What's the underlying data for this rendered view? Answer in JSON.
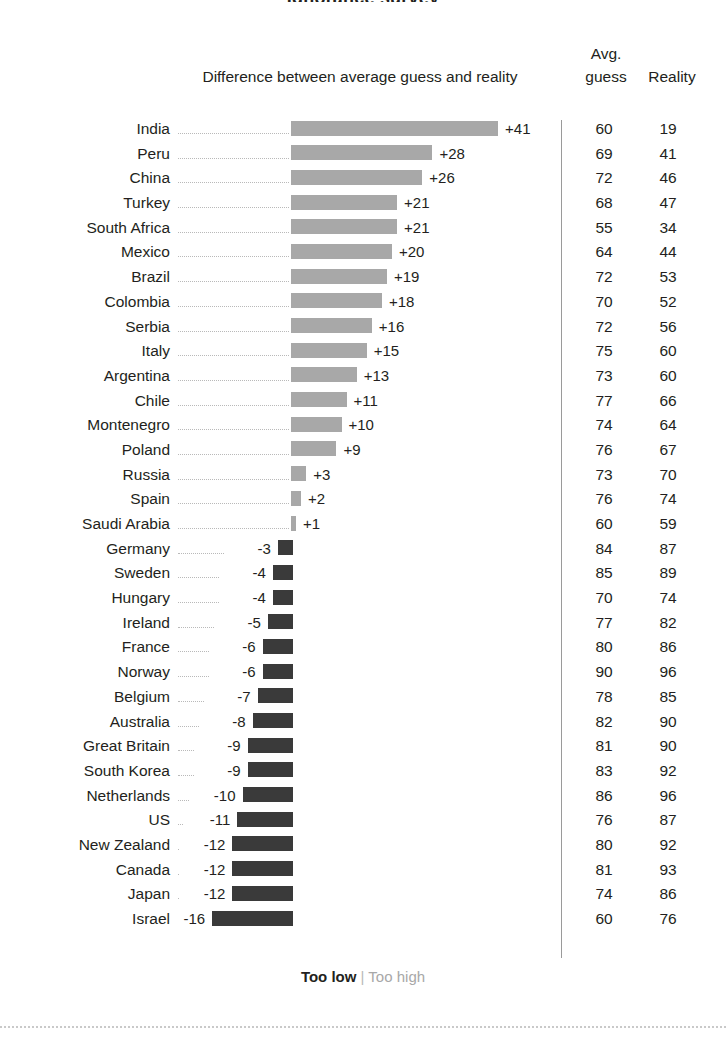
{
  "title": "Ignorance survey",
  "headers": {
    "difference": "Difference between average guess and reality",
    "avg_line1": "Avg.",
    "avg_line2": "guess",
    "reality": "Reality"
  },
  "legend": {
    "too_low": "Too low",
    "separator": "|",
    "too_high": "Too high"
  },
  "colors": {
    "too_low_bar": "#3a3a3a",
    "too_high_bar": "#a8a8a8",
    "text": "#231f20",
    "leader": "#b9b9b9",
    "rule": "#9a9a9a"
  },
  "chart_data": {
    "type": "bar",
    "title": "Difference between average guess and reality",
    "xlabel": "",
    "ylabel": "",
    "orientation": "horizontal",
    "grid": false,
    "legend_position": "bottom",
    "baseline": 0,
    "xlim": [
      -16,
      41
    ],
    "categories": [
      "India",
      "Peru",
      "China",
      "Turkey",
      "South Africa",
      "Mexico",
      "Brazil",
      "Colombia",
      "Serbia",
      "Italy",
      "Argentina",
      "Chile",
      "Montenegro",
      "Poland",
      "Russia",
      "Spain",
      "Saudi Arabia",
      "Germany",
      "Sweden",
      "Hungary",
      "Ireland",
      "France",
      "Norway",
      "Belgium",
      "Australia",
      "Great Britain",
      "South Korea",
      "Netherlands",
      "US",
      "New Zealand",
      "Canada",
      "Japan",
      "Israel"
    ],
    "series": [
      {
        "name": "Difference",
        "values": [
          41,
          28,
          26,
          21,
          21,
          20,
          19,
          18,
          16,
          15,
          13,
          11,
          10,
          9,
          3,
          2,
          1,
          -3,
          -4,
          -4,
          -5,
          -6,
          -6,
          -7,
          -8,
          -9,
          -9,
          -10,
          -11,
          -12,
          -12,
          -12,
          -16
        ]
      },
      {
        "name": "Avg. guess",
        "values": [
          60,
          69,
          72,
          68,
          55,
          64,
          72,
          70,
          72,
          75,
          73,
          77,
          74,
          76,
          73,
          76,
          60,
          84,
          85,
          70,
          77,
          80,
          90,
          78,
          82,
          81,
          83,
          86,
          76,
          80,
          81,
          74,
          60
        ]
      },
      {
        "name": "Reality",
        "values": [
          19,
          41,
          46,
          47,
          34,
          44,
          53,
          52,
          56,
          60,
          60,
          66,
          64,
          67,
          70,
          74,
          59,
          87,
          89,
          74,
          82,
          86,
          96,
          85,
          90,
          90,
          92,
          96,
          87,
          92,
          93,
          86,
          76
        ]
      }
    ]
  },
  "rows": [
    {
      "label": "India",
      "diff": 41,
      "diff_text": "+41",
      "guess": "60",
      "reality": "19"
    },
    {
      "label": "Peru",
      "diff": 28,
      "diff_text": "+28",
      "guess": "69",
      "reality": "41"
    },
    {
      "label": "China",
      "diff": 26,
      "diff_text": "+26",
      "guess": "72",
      "reality": "46"
    },
    {
      "label": "Turkey",
      "diff": 21,
      "diff_text": "+21",
      "guess": "68",
      "reality": "47"
    },
    {
      "label": "South Africa",
      "diff": 21,
      "diff_text": "+21",
      "guess": "55",
      "reality": "34"
    },
    {
      "label": "Mexico",
      "diff": 20,
      "diff_text": "+20",
      "guess": "64",
      "reality": "44"
    },
    {
      "label": "Brazil",
      "diff": 19,
      "diff_text": "+19",
      "guess": "72",
      "reality": "53"
    },
    {
      "label": "Colombia",
      "diff": 18,
      "diff_text": "+18",
      "guess": "70",
      "reality": "52"
    },
    {
      "label": "Serbia",
      "diff": 16,
      "diff_text": "+16",
      "guess": "72",
      "reality": "56"
    },
    {
      "label": "Italy",
      "diff": 15,
      "diff_text": "+15",
      "guess": "75",
      "reality": "60"
    },
    {
      "label": "Argentina",
      "diff": 13,
      "diff_text": "+13",
      "guess": "73",
      "reality": "60"
    },
    {
      "label": "Chile",
      "diff": 11,
      "diff_text": "+11",
      "guess": "77",
      "reality": "66"
    },
    {
      "label": "Montenegro",
      "diff": 10,
      "diff_text": "+10",
      "guess": "74",
      "reality": "64"
    },
    {
      "label": "Poland",
      "diff": 9,
      "diff_text": "+9",
      "guess": "76",
      "reality": "67"
    },
    {
      "label": "Russia",
      "diff": 3,
      "diff_text": "+3",
      "guess": "73",
      "reality": "70"
    },
    {
      "label": "Spain",
      "diff": 2,
      "diff_text": "+2",
      "guess": "76",
      "reality": "74"
    },
    {
      "label": "Saudi Arabia",
      "diff": 1,
      "diff_text": "+1",
      "guess": "60",
      "reality": "59"
    },
    {
      "label": "Germany",
      "diff": -3,
      "diff_text": "-3",
      "guess": "84",
      "reality": "87"
    },
    {
      "label": "Sweden",
      "diff": -4,
      "diff_text": "-4",
      "guess": "85",
      "reality": "89"
    },
    {
      "label": "Hungary",
      "diff": -4,
      "diff_text": "-4",
      "guess": "70",
      "reality": "74"
    },
    {
      "label": "Ireland",
      "diff": -5,
      "diff_text": "-5",
      "guess": "77",
      "reality": "82"
    },
    {
      "label": "France",
      "diff": -6,
      "diff_text": "-6",
      "guess": "80",
      "reality": "86"
    },
    {
      "label": "Norway",
      "diff": -6,
      "diff_text": "-6",
      "guess": "90",
      "reality": "96"
    },
    {
      "label": "Belgium",
      "diff": -7,
      "diff_text": "-7",
      "guess": "78",
      "reality": "85"
    },
    {
      "label": "Australia",
      "diff": -8,
      "diff_text": "-8",
      "guess": "82",
      "reality": "90"
    },
    {
      "label": "Great Britain",
      "diff": -9,
      "diff_text": "-9",
      "guess": "81",
      "reality": "90"
    },
    {
      "label": "South Korea",
      "diff": -9,
      "diff_text": "-9",
      "guess": "83",
      "reality": "92"
    },
    {
      "label": "Netherlands",
      "diff": -10,
      "diff_text": "-10",
      "guess": "86",
      "reality": "96"
    },
    {
      "label": "US",
      "diff": -11,
      "diff_text": "-11",
      "guess": "76",
      "reality": "87"
    },
    {
      "label": "New Zealand",
      "diff": -12,
      "diff_text": "-12",
      "guess": "80",
      "reality": "92"
    },
    {
      "label": "Canada",
      "diff": -12,
      "diff_text": "-12",
      "guess": "81",
      "reality": "93"
    },
    {
      "label": "Japan",
      "diff": -12,
      "diff_text": "-12",
      "guess": "74",
      "reality": "86"
    },
    {
      "label": "Israel",
      "diff": -16,
      "diff_text": "-16",
      "guess": "60",
      "reality": "76"
    }
  ]
}
